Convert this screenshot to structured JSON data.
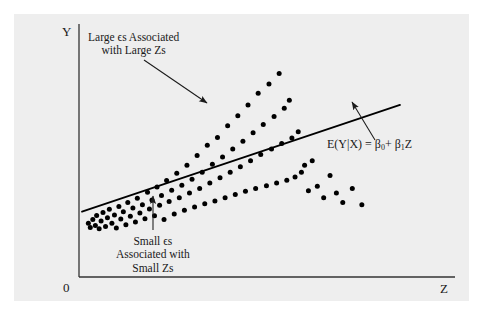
{
  "figure": {
    "background_color": "#ffffff",
    "panel_color": "#eeeeee",
    "ink_color": "#1a1a1a"
  },
  "axes": {
    "y_label": "Y",
    "x_label": "Z",
    "origin_label": "0"
  },
  "annotations": {
    "large_errors": {
      "line1": "Large ϵs Associated",
      "line2": "with Large Zs"
    },
    "small_errors": {
      "line1": "Small ϵs",
      "line2": "Associated with",
      "line3": "Small Zs"
    },
    "regression_line_label": {
      "lhs": "E(Y|X) = ",
      "beta0": "β",
      "beta0_sub": "0",
      "plus": "+ ",
      "beta1": "β",
      "beta1_sub": "1",
      "variable": "Z"
    }
  },
  "chart_data": {
    "type": "scatter",
    "title": "",
    "xlabel": "Z",
    "ylabel": "Y",
    "xlim": [
      0,
      100
    ],
    "ylim": [
      0,
      100
    ],
    "grid": false,
    "legend": "none",
    "regression_line": {
      "name": "E(Y|X) = β₀ + β₁Z",
      "x_start": 0,
      "y_start": 26,
      "x_end": 100,
      "y_end": 72,
      "color": "#000000",
      "width": 1.8
    },
    "points": [
      [
        2.0,
        21.0
      ],
      [
        2.6,
        19.2
      ],
      [
        3.4,
        22.6
      ],
      [
        4.2,
        20.0
      ],
      [
        4.6,
        24.4
      ],
      [
        5.4,
        18.6
      ],
      [
        6.0,
        22.0
      ],
      [
        6.6,
        25.6
      ],
      [
        7.4,
        19.6
      ],
      [
        8.0,
        23.4
      ],
      [
        8.6,
        27.0
      ],
      [
        9.4,
        21.0
      ],
      [
        10.2,
        24.6
      ],
      [
        10.8,
        19.0
      ],
      [
        11.6,
        28.2
      ],
      [
        12.2,
        22.8
      ],
      [
        13.0,
        26.0
      ],
      [
        13.8,
        20.4
      ],
      [
        14.4,
        30.0
      ],
      [
        15.2,
        24.0
      ],
      [
        16.0,
        27.6
      ],
      [
        16.8,
        21.6
      ],
      [
        17.4,
        31.8
      ],
      [
        18.2,
        25.4
      ],
      [
        19.0,
        29.0
      ],
      [
        19.8,
        23.0
      ],
      [
        20.6,
        34.4
      ],
      [
        21.2,
        27.2
      ],
      [
        22.0,
        31.0
      ],
      [
        22.8,
        24.2
      ],
      [
        23.6,
        36.6
      ],
      [
        24.4,
        28.8
      ],
      [
        25.0,
        33.0
      ],
      [
        25.8,
        22.6
      ],
      [
        26.6,
        39.4
      ],
      [
        27.4,
        30.4
      ],
      [
        28.2,
        35.2
      ],
      [
        29.0,
        25.0
      ],
      [
        29.8,
        42.6
      ],
      [
        30.6,
        32.0
      ],
      [
        31.4,
        37.4
      ],
      [
        32.2,
        26.6
      ],
      [
        33.0,
        46.0
      ],
      [
        33.8,
        34.0
      ],
      [
        34.6,
        40.0
      ],
      [
        35.4,
        28.0
      ],
      [
        36.2,
        50.2
      ],
      [
        37.0,
        36.0
      ],
      [
        37.8,
        43.0
      ],
      [
        38.6,
        29.4
      ],
      [
        39.4,
        54.6
      ],
      [
        40.2,
        38.4
      ],
      [
        41.0,
        46.4
      ],
      [
        41.8,
        30.6
      ],
      [
        42.6,
        58.0
      ],
      [
        43.4,
        40.6
      ],
      [
        44.2,
        49.6
      ],
      [
        45.0,
        32.0
      ],
      [
        45.8,
        63.0
      ],
      [
        46.6,
        43.0
      ],
      [
        47.4,
        53.0
      ],
      [
        48.2,
        33.4
      ],
      [
        49.0,
        67.4
      ],
      [
        49.8,
        45.4
      ],
      [
        50.6,
        56.4
      ],
      [
        51.4,
        34.8
      ],
      [
        52.2,
        72.0
      ],
      [
        53.0,
        48.0
      ],
      [
        53.8,
        60.0
      ],
      [
        54.6,
        36.0
      ],
      [
        55.4,
        77.0
      ],
      [
        56.2,
        50.6
      ],
      [
        57.0,
        63.6
      ],
      [
        58.0,
        37.2
      ],
      [
        58.8,
        81.0
      ],
      [
        59.6,
        53.0
      ],
      [
        60.4,
        67.0
      ],
      [
        61.2,
        38.4
      ],
      [
        62.0,
        85.6
      ],
      [
        62.8,
        55.4
      ],
      [
        63.6,
        70.6
      ],
      [
        64.4,
        39.6
      ],
      [
        65.2,
        74.0
      ],
      [
        66.0,
        57.8
      ],
      [
        67.0,
        41.0
      ],
      [
        68.0,
        60.4
      ],
      [
        69.0,
        43.0
      ],
      [
        70.0,
        46.0
      ],
      [
        71.2,
        35.0
      ],
      [
        72.4,
        48.0
      ],
      [
        74.0,
        37.0
      ],
      [
        76.0,
        32.0
      ],
      [
        78.0,
        41.6
      ],
      [
        80.0,
        34.0
      ],
      [
        82.0,
        30.0
      ],
      [
        85.0,
        36.0
      ],
      [
        88.0,
        29.0
      ]
    ]
  }
}
